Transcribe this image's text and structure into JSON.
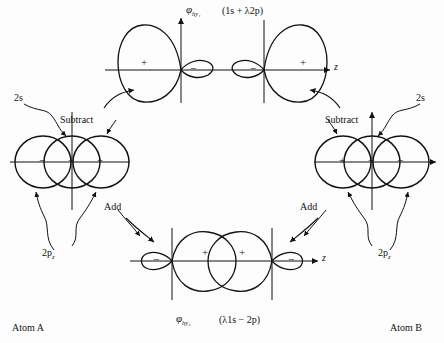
{
  "figure": {
    "type": "diagram",
    "background_color": "#fdfdfd",
    "stroke_color": "#111111"
  },
  "top_panel": {
    "orbital_label": "φ",
    "orbital_subscript": "hy₁",
    "formula": "(1s + λ2p)",
    "axis_label": "z",
    "left_lobe_sign": "+",
    "left_small_lobe_sign": "−",
    "right_lobe_sign": "+",
    "right_small_lobe_sign": "−"
  },
  "bottom_panel": {
    "orbital_label": "φ",
    "orbital_subscript": "hy₂",
    "formula": "(λ1s − 2p)",
    "axis_label": "z",
    "left_lobe_sign": "+",
    "left_small_lobe_sign": "−",
    "right_lobe_sign": "+",
    "right_small_lobe_sign": "−"
  },
  "atom_a": {
    "name": "Atom A",
    "s_orbital_label": "2s",
    "p_orbital_label": "2p",
    "p_orbital_subscript": "z",
    "signs": [
      "−",
      "+",
      "+"
    ],
    "operation_up": "Subtract",
    "operation_down": "Add",
    "axis_label": "z"
  },
  "atom_b": {
    "name": "Atom B",
    "s_orbital_label": "2s",
    "p_orbital_label": "2p",
    "p_orbital_subscript": "z",
    "signs": [
      "+",
      "+",
      "−"
    ],
    "operation_up": "Subtract",
    "operation_down": "Add",
    "axis_label": "z"
  }
}
